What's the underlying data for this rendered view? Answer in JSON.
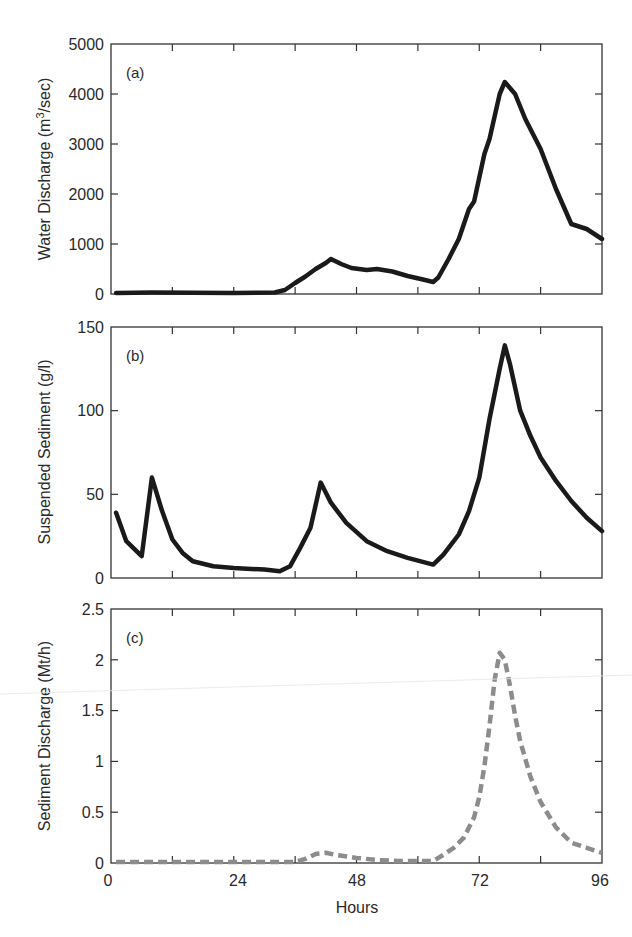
{
  "chart_data": [
    {
      "type": "line",
      "panel_tag": "(a)",
      "title": "",
      "xlabel": "",
      "ylabel": "Water Discharge (m3/sec)",
      "ylabel_parts": {
        "pre": "Water Discharge (m",
        "sup": "3",
        "post": "/sec)"
      },
      "xlim": [
        0,
        96
      ],
      "ylim": [
        0,
        5000
      ],
      "yticks": [
        0,
        1000,
        2000,
        3000,
        4000,
        5000
      ],
      "ytick_labels": [
        "0",
        "1000",
        "2000",
        "3000",
        "4000",
        "5000"
      ],
      "xticks": [
        0,
        12,
        24,
        36,
        48,
        60,
        72,
        84,
        96
      ],
      "grid": false,
      "series": [
        {
          "name": "Water Discharge",
          "color": "#1a1a1a",
          "style": "solid",
          "x": [
            1,
            8,
            16,
            24,
            32,
            34,
            36,
            38,
            40,
            42,
            43,
            45,
            47,
            50,
            52,
            55,
            58,
            61,
            63,
            64,
            66,
            68,
            70,
            71,
            73,
            74,
            76,
            77,
            79,
            81,
            84,
            87,
            90,
            93,
            96
          ],
          "y": [
            20,
            30,
            25,
            20,
            30,
            80,
            220,
            350,
            500,
            620,
            700,
            600,
            520,
            480,
            500,
            450,
            360,
            290,
            240,
            330,
            700,
            1100,
            1700,
            1850,
            2800,
            3100,
            4000,
            4240,
            4000,
            3500,
            2900,
            2100,
            1400,
            1300,
            1100
          ]
        }
      ]
    },
    {
      "type": "line",
      "panel_tag": "(b)",
      "title": "",
      "xlabel": "",
      "ylabel": "Suspended Sediment (g/l)",
      "xlim": [
        0,
        96
      ],
      "ylim": [
        0,
        150
      ],
      "yticks": [
        0,
        50,
        100,
        150
      ],
      "ytick_labels": [
        "0",
        "50",
        "100",
        "150"
      ],
      "xticks": [
        0,
        12,
        24,
        36,
        48,
        60,
        72,
        84,
        96
      ],
      "grid": false,
      "series": [
        {
          "name": "Suspended Sediment",
          "color": "#1a1a1a",
          "style": "solid",
          "x": [
            1,
            3,
            6,
            8,
            10,
            12,
            14,
            16,
            20,
            24,
            30,
            33,
            35,
            37,
            39,
            41,
            43,
            46,
            50,
            54,
            58,
            63,
            65,
            68,
            70,
            72,
            74,
            76,
            77,
            78,
            80,
            82,
            84,
            87,
            90,
            93,
            96
          ],
          "y": [
            39,
            22,
            13,
            60,
            40,
            23,
            15,
            10,
            7,
            6,
            5,
            4,
            7,
            18,
            30,
            57,
            45,
            33,
            22,
            16,
            12,
            8,
            14,
            26,
            40,
            60,
            95,
            125,
            139,
            128,
            100,
            85,
            72,
            58,
            46,
            36,
            28
          ]
        }
      ]
    },
    {
      "type": "line",
      "panel_tag": "(c)",
      "title": "",
      "xlabel": "Hours",
      "ylabel": "Sediment Discharge (Mt/h)",
      "xlim": [
        0,
        96
      ],
      "ylim": [
        0,
        2.5
      ],
      "yticks": [
        0,
        0.5,
        1,
        1.5,
        2,
        2.5
      ],
      "ytick_labels": [
        "0",
        "0.5",
        "1",
        "1.5",
        "2",
        "2.5"
      ],
      "xticks": [
        0,
        12,
        24,
        36,
        48,
        60,
        72,
        84,
        96
      ],
      "xtick_labels": [
        "0",
        "",
        "24",
        "",
        "48",
        "",
        "72",
        "",
        "96"
      ],
      "grid": false,
      "series": [
        {
          "name": "Sediment Discharge",
          "color": "#8c8c8c",
          "style": "dashed",
          "x": [
            1,
            12,
            24,
            36,
            38,
            40,
            42,
            44,
            48,
            52,
            56,
            60,
            63,
            65,
            67,
            69,
            71,
            72,
            73,
            74,
            75,
            76,
            77,
            78,
            79,
            80,
            82,
            84,
            87,
            90,
            93,
            96
          ],
          "y": [
            0.01,
            0.01,
            0.01,
            0.01,
            0.04,
            0.09,
            0.1,
            0.08,
            0.05,
            0.03,
            0.02,
            0.02,
            0.02,
            0.08,
            0.15,
            0.25,
            0.45,
            0.65,
            0.95,
            1.35,
            1.8,
            2.07,
            2.0,
            1.75,
            1.45,
            1.2,
            0.85,
            0.6,
            0.35,
            0.2,
            0.15,
            0.1
          ]
        }
      ]
    }
  ],
  "labels": {
    "panel_a_tag": "(a)",
    "panel_b_tag": "(b)",
    "panel_c_tag": "(c)",
    "ylabel_a_pre": "Water Discharge (m",
    "ylabel_a_sup": "3",
    "ylabel_a_post": "/sec)",
    "ylabel_b": "Suspended Sediment (g/l)",
    "ylabel_c": "Sediment Discharge (Mt/h)",
    "xlabel": "Hours",
    "xtick_0": "0",
    "xtick_24": "24",
    "xtick_48": "48",
    "xtick_72": "72",
    "xtick_96": "96",
    "a_y0": "0",
    "a_y1000": "1000",
    "a_y2000": "2000",
    "a_y3000": "3000",
    "a_y4000": "4000",
    "a_y5000": "5000",
    "b_y0": "0",
    "b_y50": "50",
    "b_y100": "100",
    "b_y150": "150",
    "c_y0": "0",
    "c_y05": "0.5",
    "c_y1": "1",
    "c_y15": "1.5",
    "c_y2": "2",
    "c_y25": "2.5"
  }
}
